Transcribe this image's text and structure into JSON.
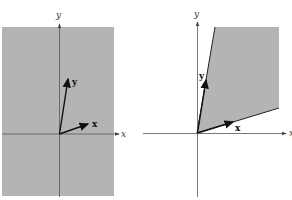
{
  "figure": {
    "colors": {
      "region": "#b4b4b4",
      "axis": "#555555",
      "vector": "#111111",
      "background": "#ffffff"
    },
    "left_panel": {
      "description": "Entire plane shaded (span of x and y)",
      "axis_labels": {
        "x": "x",
        "y": "y"
      },
      "vector_labels": {
        "x": "x",
        "y": "y"
      },
      "region": {
        "x": 2,
        "y": 27,
        "width": 112,
        "height": 169
      },
      "origin": [
        59,
        134
      ],
      "vector_x_tip": [
        88,
        124
      ],
      "vector_y_tip": [
        67,
        78
      ]
    },
    "right_panel": {
      "description": "Cone spanned by non-negative combinations of x and y",
      "axis_labels": {
        "x": "x",
        "y": "y"
      },
      "vector_labels": {
        "x": "x",
        "y": "y"
      },
      "origin": [
        197,
        133
      ],
      "region_polygon": [
        [
          197,
          133
        ],
        [
          215,
          27
        ],
        [
          279,
          27
        ],
        [
          279,
          108
        ]
      ],
      "vector_x_tip": [
        232,
        122
      ],
      "vector_y_tip": [
        205,
        80
      ]
    }
  }
}
